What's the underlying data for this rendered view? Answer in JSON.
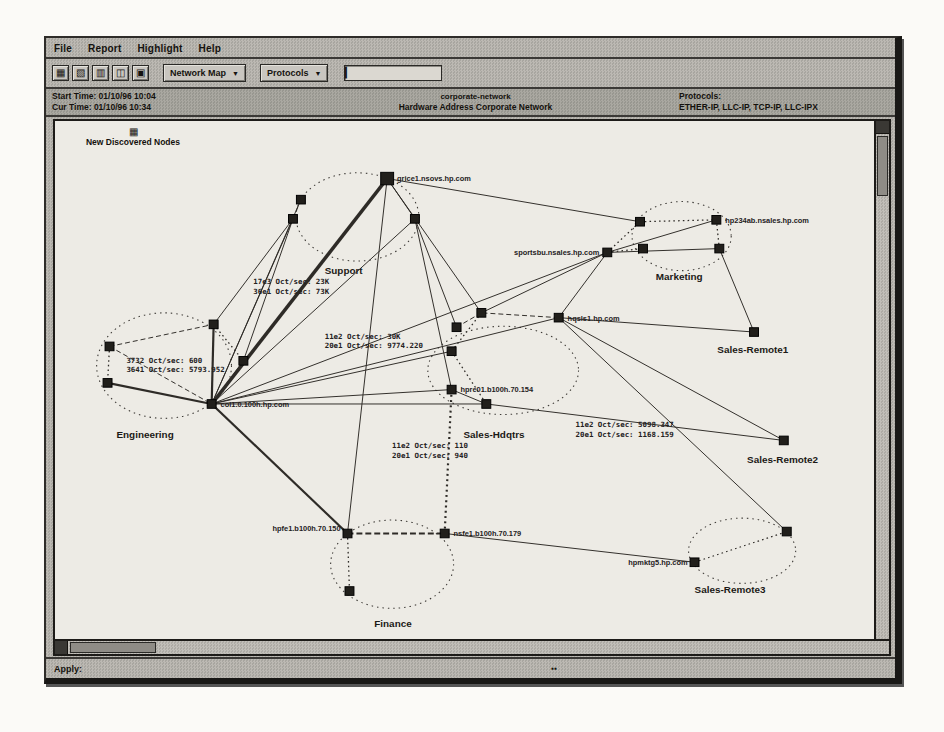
{
  "menubar": {
    "items": [
      "File",
      "Report",
      "Highlight",
      "Help"
    ]
  },
  "toolbar": {
    "buttons": [
      {
        "name": "map-grid-icon",
        "glyph": "▦"
      },
      {
        "name": "new-window-icon",
        "glyph": "▧"
      },
      {
        "name": "layout-icon",
        "glyph": "▥"
      },
      {
        "name": "node-list-icon",
        "glyph": "◫"
      },
      {
        "name": "print-icon",
        "glyph": "▣"
      }
    ],
    "dropdown1": {
      "label": "Network Map",
      "arrow": "▼"
    },
    "dropdown2": {
      "label": "Protocols",
      "arrow": "▼"
    },
    "input": {
      "value": "",
      "caret": "▎"
    }
  },
  "header": {
    "left": {
      "line1": "Start Time: 01/10/96 10:04",
      "line2": "Cur Time: 01/10/96 10:34"
    },
    "center": {
      "line1": "corporate-network",
      "line2": "Hardware Address Corporate Network"
    },
    "right": {
      "line1": "Protocols:",
      "line2": "ETHER-IP, LLC-IP, TCP-IP, LLC-IPX"
    }
  },
  "status": {
    "left": "Apply:",
    "marker": "▪▪"
  },
  "map": {
    "new_nodes": {
      "icon": "▦",
      "label": "New Discovered Nodes"
    },
    "clusters": [
      {
        "label": "Engineering",
        "cx": 110,
        "cy": 255,
        "rx": 68,
        "ry": 55,
        "lx": 62,
        "ly": 330
      },
      {
        "label": "Support",
        "cx": 305,
        "cy": 100,
        "rx": 62,
        "ry": 46,
        "lx": 272,
        "ly": 160
      },
      {
        "label": "Marketing",
        "cx": 632,
        "cy": 120,
        "rx": 50,
        "ry": 36,
        "lx": 606,
        "ly": 166
      },
      {
        "label": "Sales-Hdqtrs",
        "cx": 452,
        "cy": 260,
        "rx": 76,
        "ry": 46,
        "lx": 412,
        "ly": 330
      },
      {
        "label": "Finance",
        "cx": 340,
        "cy": 462,
        "rx": 62,
        "ry": 46,
        "lx": 322,
        "ly": 527
      },
      {
        "label": "Sales-Remote3",
        "cx": 693,
        "cy": 448,
        "rx": 54,
        "ry": 34,
        "lx": 645,
        "ly": 492
      },
      {
        "label": "Sales-Remote1",
        "rx": 0,
        "lx": 668,
        "ly": 242
      },
      {
        "label": "Sales-Remote2",
        "rx": 0,
        "lx": 698,
        "ly": 357
      }
    ],
    "nodes": [
      {
        "id": "e1",
        "x": 55,
        "y": 235
      },
      {
        "id": "e2",
        "x": 53,
        "y": 273
      },
      {
        "id": "e3",
        "x": 160,
        "y": 212
      },
      {
        "id": "e4",
        "x": 190,
        "y": 250
      },
      {
        "id": "hub",
        "x": 158,
        "y": 295,
        "label": "col1.0.100h.hp.com",
        "anchor": "start",
        "dx": 9,
        "dy": 3
      },
      {
        "id": "s1",
        "x": 248,
        "y": 82
      },
      {
        "id": "s2",
        "x": 240,
        "y": 102
      },
      {
        "id": "big",
        "x": 335,
        "y": 60,
        "size": 13,
        "label": "grice1.nsovs.hp.com",
        "anchor": "start",
        "dx": 10,
        "dy": 3
      },
      {
        "id": "s3",
        "x": 363,
        "y": 102
      },
      {
        "id": "m0",
        "x": 557,
        "y": 137,
        "label": "sportsbu.nsales.hp.com",
        "anchor": "end",
        "dx": -8,
        "dy": 3
      },
      {
        "id": "m1",
        "x": 590,
        "y": 105
      },
      {
        "id": "m2",
        "x": 593,
        "y": 133
      },
      {
        "id": "m3",
        "x": 667,
        "y": 103,
        "label": "hp234ab.nsales.hp.com",
        "anchor": "start",
        "dx": 9,
        "dy": 3
      },
      {
        "id": "m4",
        "x": 670,
        "y": 133
      },
      {
        "id": "sr1",
        "x": 705,
        "y": 220
      },
      {
        "id": "sr2",
        "x": 735,
        "y": 333
      },
      {
        "id": "sh1",
        "x": 405,
        "y": 215
      },
      {
        "id": "sh2",
        "x": 430,
        "y": 200
      },
      {
        "id": "sh3",
        "x": 400,
        "y": 240
      },
      {
        "id": "sh4",
        "x": 435,
        "y": 295
      },
      {
        "id": "sh5",
        "x": 508,
        "y": 205,
        "label": "hqsls1.hp.com",
        "anchor": "start",
        "dx": 9,
        "dy": 3
      },
      {
        "id": "cn",
        "x": 400,
        "y": 280,
        "label": "hpre01.b100h.70.154",
        "anchor": "start",
        "dx": 9,
        "dy": 3
      },
      {
        "id": "f1",
        "x": 295,
        "y": 430,
        "label": "hpfe1.b100h.70.150",
        "anchor": "end",
        "dx": -7,
        "dy": -3
      },
      {
        "id": "f2",
        "x": 393,
        "y": 430,
        "label": "nsfe1.b100h.70.179",
        "anchor": "start",
        "dx": 9,
        "dy": 3
      },
      {
        "id": "f3",
        "x": 297,
        "y": 490
      },
      {
        "id": "r3a",
        "x": 645,
        "y": 460,
        "label": "hpmktg5.hp.com",
        "anchor": "end",
        "dx": -7,
        "dy": 3
      },
      {
        "id": "r3b",
        "x": 738,
        "y": 428
      }
    ],
    "links": [
      {
        "from": "big",
        "to": "hub",
        "style": "heavy"
      },
      {
        "from": "hub",
        "to": "e2",
        "style": "thick"
      },
      {
        "from": "hub",
        "to": "e3",
        "style": "thick"
      },
      {
        "from": "hub",
        "to": "f1",
        "style": "thick"
      },
      {
        "from": "f1",
        "to": "f2",
        "style": "dashthick"
      },
      {
        "from": "cn",
        "to": "f2",
        "style": "dotthick"
      },
      {
        "from": "hub",
        "to": "s1",
        "style": "thin"
      },
      {
        "from": "hub",
        "to": "s2",
        "style": "thin"
      },
      {
        "from": "hub",
        "to": "s3",
        "style": "thin"
      },
      {
        "from": "hub",
        "to": "sh3",
        "style": "thin"
      },
      {
        "from": "hub",
        "to": "sh4",
        "style": "thin"
      },
      {
        "from": "hub",
        "to": "m0",
        "style": "thin"
      },
      {
        "from": "hub",
        "to": "cn",
        "style": "thin"
      },
      {
        "from": "hub",
        "to": "sh5",
        "style": "thin"
      },
      {
        "from": "e4",
        "to": "hub",
        "style": "thin"
      },
      {
        "from": "big",
        "to": "m1",
        "style": "thin"
      },
      {
        "from": "big",
        "to": "sh2",
        "style": "thin"
      },
      {
        "from": "big",
        "to": "f1",
        "style": "thin"
      },
      {
        "from": "big",
        "to": "s3",
        "style": "thin"
      },
      {
        "from": "e3",
        "to": "s2",
        "style": "thin"
      },
      {
        "from": "e4",
        "to": "s2",
        "style": "thin"
      },
      {
        "from": "s3",
        "to": "sh1",
        "style": "thin"
      },
      {
        "from": "s3",
        "to": "cn",
        "style": "thin"
      },
      {
        "from": "sh5",
        "to": "m0",
        "style": "thin"
      },
      {
        "from": "sh5",
        "to": "sr1",
        "style": "thin"
      },
      {
        "from": "sh5",
        "to": "sr2",
        "style": "thin"
      },
      {
        "from": "sh5",
        "to": "r3b",
        "style": "thin"
      },
      {
        "from": "sh5",
        "to": "sh2",
        "style": "dash"
      },
      {
        "from": "m0",
        "to": "m3",
        "style": "thin"
      },
      {
        "from": "m0",
        "to": "m4",
        "style": "thin"
      },
      {
        "from": "m4",
        "to": "sr1",
        "style": "thin"
      },
      {
        "from": "m0",
        "to": "sh2",
        "style": "thin"
      },
      {
        "from": "sh4",
        "to": "sr2",
        "style": "thin"
      },
      {
        "from": "sh4",
        "to": "cn",
        "style": "thin"
      },
      {
        "from": "f2",
        "to": "r3a",
        "style": "thin"
      },
      {
        "from": "e1",
        "to": "e3",
        "style": "dash"
      },
      {
        "from": "e1",
        "to": "hub",
        "style": "dash"
      },
      {
        "from": "s1",
        "to": "s2",
        "style": "dash"
      },
      {
        "from": "sh1",
        "to": "sh2",
        "style": "dash"
      },
      {
        "from": "e1",
        "to": "e2",
        "style": "dot"
      },
      {
        "from": "e3",
        "to": "e4",
        "style": "dot"
      },
      {
        "from": "m0",
        "to": "m1",
        "style": "dot"
      },
      {
        "from": "m0",
        "to": "m2",
        "style": "dot"
      },
      {
        "from": "m1",
        "to": "m3",
        "style": "dot"
      },
      {
        "from": "m3",
        "to": "m4",
        "style": "dot"
      },
      {
        "from": "sh3",
        "to": "sh4",
        "style": "dot"
      },
      {
        "from": "sh2",
        "to": "sh3",
        "style": "dot"
      },
      {
        "from": "f1",
        "to": "f3",
        "style": "dot"
      },
      {
        "from": "r3a",
        "to": "r3b",
        "style": "dot"
      }
    ],
    "stats": [
      {
        "x": 72,
        "y": 252,
        "l1": "3732 Oct/sec:  600",
        "l2": "3641 Oct/sec:  5793.952"
      },
      {
        "x": 200,
        "y": 170,
        "l1": "17e3 Oct/sec:  23K",
        "l2": "36e1 Oct/sec:  73K"
      },
      {
        "x": 272,
        "y": 227,
        "l1": "11e2 Oct/sec:  30K",
        "l2": "20e1 Oct/sec:  9774.220"
      },
      {
        "x": 340,
        "y": 341,
        "l1": "11e2 Oct/sec:  110",
        "l2": "20e1 Oct/sec:  940"
      },
      {
        "x": 525,
        "y": 319,
        "l1": "11e2 Oct/sec:  5098.347",
        "l2": "20e1 Oct/sec:  1168.159"
      }
    ]
  }
}
